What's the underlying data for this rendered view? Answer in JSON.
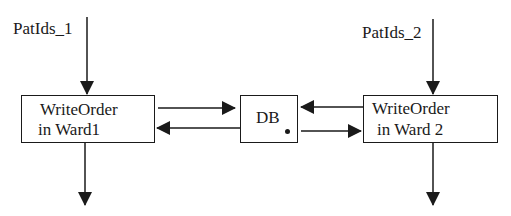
{
  "diagram": {
    "inputs": [
      {
        "id": "patids1",
        "label": "PatIds_1"
      },
      {
        "id": "patids2",
        "label": "PatIds_2"
      }
    ],
    "nodes": [
      {
        "id": "ward1",
        "lines": [
          "WriteOrder",
          "in Ward1"
        ]
      },
      {
        "id": "db",
        "lines": [
          "DB"
        ]
      },
      {
        "id": "ward2",
        "lines": [
          "WriteOrder",
          "in Ward 2"
        ]
      }
    ],
    "edges": [
      {
        "from": "patids1",
        "to": "ward1"
      },
      {
        "from": "patids2",
        "to": "ward2"
      },
      {
        "from": "ward1",
        "to": "db"
      },
      {
        "from": "db",
        "to": "ward1"
      },
      {
        "from": "ward2",
        "to": "db"
      },
      {
        "from": "db",
        "to": "ward2"
      },
      {
        "from": "ward1",
        "to": "output1"
      },
      {
        "from": "ward2",
        "to": "output2"
      }
    ]
  }
}
